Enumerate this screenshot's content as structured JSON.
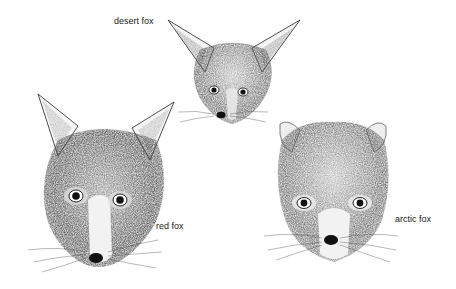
{
  "figure": {
    "foxes": [
      {
        "name": "desert fox",
        "label": "desert fox"
      },
      {
        "name": "red fox",
        "label": "red fox"
      },
      {
        "name": "arctic fox",
        "label": "arctic fox"
      }
    ]
  }
}
